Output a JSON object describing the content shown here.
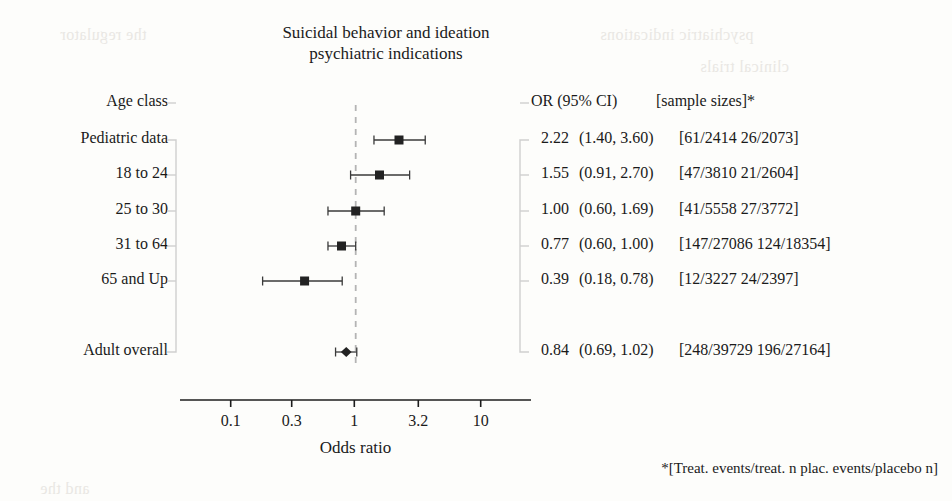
{
  "title": {
    "line1": "Suicidal behavior and ideation",
    "line2": "psychiatric indications"
  },
  "header": {
    "left_label": "Age class",
    "or_label": "OR (95% CI)",
    "samplesize_label": "[sample sizes]*"
  },
  "axis": {
    "label": "Odds ratio",
    "ticks": [
      "0.1",
      "0.3",
      "1",
      "3.2",
      "10"
    ],
    "tick_values": [
      0.1,
      0.3,
      1,
      3.2,
      10
    ],
    "reference_line": 1
  },
  "footnote": "*[Treat. events/treat. n   plac. events/placebo n]",
  "colors": {
    "marker": "#222222",
    "whisker": "#3a3a3a",
    "bracket": "#cfcfcf",
    "reference": "#b4b4b4",
    "axis": "#1c1c1c",
    "text": "#1a1a1a",
    "background": "#fdfdfb"
  },
  "ghost_text": [
    {
      "text": "the regulator",
      "x": 60,
      "y": 26
    },
    {
      "text": "psychiatric indications",
      "x": 600,
      "y": 26
    },
    {
      "text": "clinical trials",
      "x": 700,
      "y": 58
    },
    {
      "text": "and the",
      "x": 40,
      "y": 480
    }
  ],
  "chart_data": {
    "type": "forest",
    "title": "Suicidal behavior and ideation psychiatric indications",
    "xlabel": "Odds ratio",
    "ylabel": "Age class",
    "xscale": "log",
    "xlim": [
      0.08,
      13
    ],
    "xticks": [
      0.1,
      0.3,
      1,
      3.2,
      10
    ],
    "xticklabels": [
      "0.1",
      "0.3",
      "1",
      "3.2",
      "10"
    ],
    "reference_line": 1,
    "grid": false,
    "legend": "none",
    "columns": [
      "Age class",
      "OR (95% CI)",
      "[sample sizes]*"
    ],
    "rows": [
      {
        "label": "Pediatric data",
        "or": 2.22,
        "or_text": "2.22",
        "ci_low": 1.4,
        "ci_high": 3.6,
        "ci_text": "(1.40, 3.60)",
        "sample_sizes": "[61/2414 26/2073]",
        "marker": "square",
        "marker_size": 9,
        "summary": false
      },
      {
        "label": "18 to 24",
        "or": 1.55,
        "or_text": "1.55",
        "ci_low": 0.91,
        "ci_high": 2.7,
        "ci_text": "(0.91, 2.70)",
        "sample_sizes": "[47/3810 21/2604]",
        "marker": "square",
        "marker_size": 9,
        "summary": false
      },
      {
        "label": "25 to 30",
        "or": 1.0,
        "or_text": "1.00",
        "ci_low": 0.6,
        "ci_high": 1.69,
        "ci_text": "(0.60, 1.69)",
        "sample_sizes": "[41/5558 27/3772]",
        "marker": "square",
        "marker_size": 9,
        "summary": false
      },
      {
        "label": "31 to 64",
        "or": 0.77,
        "or_text": "0.77",
        "ci_low": 0.6,
        "ci_high": 1.0,
        "ci_text": "(0.60, 1.00)",
        "sample_sizes": "[147/27086 124/18354]",
        "marker": "square",
        "marker_size": 9,
        "summary": false
      },
      {
        "label": "65 and Up",
        "or": 0.39,
        "or_text": "0.39",
        "ci_low": 0.18,
        "ci_high": 0.78,
        "ci_text": "(0.18, 0.78)",
        "sample_sizes": "[12/3227 24/2397]",
        "marker": "square",
        "marker_size": 9,
        "summary": false
      },
      {
        "label": "Adult overall",
        "or": 0.84,
        "or_text": "0.84",
        "ci_low": 0.69,
        "ci_high": 1.02,
        "ci_text": "(0.69, 1.02)",
        "sample_sizes": "[248/39729 196/27164]",
        "marker": "diamond",
        "marker_size": 8,
        "summary": true
      }
    ]
  },
  "layout": {
    "plot_left": 180,
    "plot_right": 531,
    "axis_y": 400,
    "header_y": 103,
    "row_y": [
      140,
      175,
      211,
      246,
      281,
      352
    ],
    "bracket_left_x": 176,
    "bracket_right_x": 520,
    "tick_x": [
      230.7,
      291.7,
      354.3,
      418.3,
      480.7
    ]
  }
}
